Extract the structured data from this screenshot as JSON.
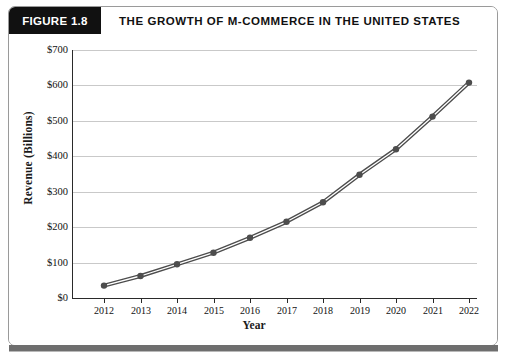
{
  "figure": {
    "tag_label": "FIGURE 1.8",
    "title": "THE GROWTH OF M-COMMERCE IN THE UNITED STATES"
  },
  "chart_data": {
    "type": "line",
    "title": "THE GROWTH OF M-COMMERCE IN THE UNITED STATES",
    "xlabel": "Year",
    "ylabel": "Revenue (Billions)",
    "categories": [
      "2012",
      "2013",
      "2014",
      "2015",
      "2016",
      "2017",
      "2018",
      "2019",
      "2020",
      "2021",
      "2022"
    ],
    "x": [
      2012,
      2013,
      2014,
      2015,
      2016,
      2017,
      2018,
      2019,
      2020,
      2021,
      2022
    ],
    "values": [
      35,
      62,
      95,
      128,
      170,
      215,
      270,
      348,
      420,
      512,
      608
    ],
    "series": [
      {
        "name": "M-Commerce Revenue",
        "values": [
          35,
          62,
          95,
          128,
          170,
          215,
          270,
          348,
          420,
          512,
          608
        ]
      }
    ],
    "ylim": [
      0,
      700
    ],
    "ytick_values": [
      0,
      100,
      200,
      300,
      400,
      500,
      600,
      700
    ],
    "ytick_labels": [
      "$0",
      "$100",
      "$200",
      "$300",
      "$400",
      "$500",
      "$600",
      "$700"
    ],
    "xtick_labels": [
      "2012",
      "2013",
      "2014",
      "2015",
      "2016",
      "2017",
      "2018",
      "2019",
      "2020",
      "2021",
      "2022"
    ],
    "grid": "horizontal",
    "legend": "none",
    "line_color": "#4d4d4d",
    "marker_color": "#4d4d4d",
    "gridline_color": "#c9c9c9",
    "axis_color": "#2a2a2a"
  },
  "style": {
    "tag_background": "#111111",
    "tag_text_color": "#ffffff",
    "frame_border": "#9a9a9a",
    "bottom_rule_color": "#6e6e6e"
  }
}
